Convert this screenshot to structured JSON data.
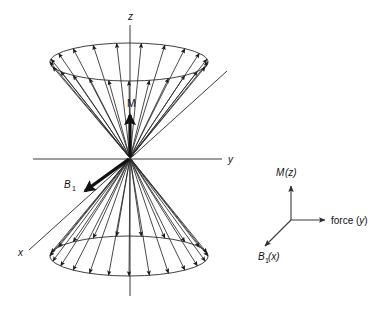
{
  "figure": {
    "kind": "precession-cone-diagram",
    "background_color": "#ffffff",
    "line_color": "#2b2b2b",
    "axis_color": "#3a3a3a",
    "vector_color": "#111111",
    "width": 383,
    "height": 313
  },
  "main_diagram": {
    "origin": {
      "x": 130,
      "y": 158
    },
    "axes": [
      {
        "name": "z-axis",
        "label": "z",
        "italic": true,
        "label_x": 128,
        "label_y": 20,
        "x1": 130,
        "y1": 25,
        "x2": 130,
        "y2": 296
      },
      {
        "name": "y-axis",
        "label": "y",
        "italic": true,
        "label_x": 228,
        "label_y": 163,
        "x1": 33,
        "y1": 159,
        "x2": 222,
        "y2": 159
      },
      {
        "name": "x-axis",
        "label": "x",
        "italic": true,
        "label_x": 18,
        "label_y": 256,
        "x1": 29,
        "y1": 250,
        "x2": 227,
        "y2": 71
      }
    ],
    "upper_cone": {
      "name": "upper-precession-cone",
      "ellipse_cx": 129,
      "ellipse_cy": 62,
      "ellipse_rx": 79,
      "ellipse_ry": 19,
      "ray_count": 13
    },
    "lower_cone": {
      "name": "lower-precession-cone",
      "ellipse_cx": 129,
      "ellipse_cy": 256,
      "ellipse_rx": 79,
      "ellipse_ry": 20,
      "ray_count": 13
    },
    "magnetization_vector": {
      "name": "magnetization-vector",
      "label": "M",
      "italic": false,
      "label_x": 127,
      "label_y": 107,
      "x1": 130,
      "y1": 157,
      "x2": 130,
      "y2": 115
    },
    "b1_vector": {
      "name": "b1-field-vector",
      "label": "B",
      "subscript": "1",
      "italic": true,
      "label_x": 64,
      "label_y": 188,
      "sub_x": 72,
      "sub_y": 191,
      "x1": 129,
      "y1": 159,
      "x2": 85,
      "y2": 191
    }
  },
  "legend": {
    "name": "coordinate-legend",
    "origin": {
      "x": 291,
      "y": 220
    },
    "entries": [
      {
        "name": "legend-m-z",
        "label": "M(z)",
        "label_x": 276,
        "label_y": 176,
        "x1": 291,
        "y1": 220,
        "x2": 291,
        "y2": 186,
        "direction": "up"
      },
      {
        "name": "legend-force-y",
        "label": "force (y)",
        "label_x": 331,
        "label_y": 224,
        "x1": 291,
        "y1": 220,
        "x2": 325,
        "y2": 220,
        "direction": "right"
      },
      {
        "name": "legend-b1-x",
        "label": "B",
        "subscript": "1",
        "label_suffix": "(x)",
        "label_x": 258,
        "label_y": 260,
        "sub_x": 265,
        "sub_y": 263,
        "suffix_x": 268,
        "suffix_y": 260,
        "x1": 291,
        "y1": 220,
        "x2": 265,
        "y2": 246,
        "direction": "down-left"
      }
    ]
  }
}
